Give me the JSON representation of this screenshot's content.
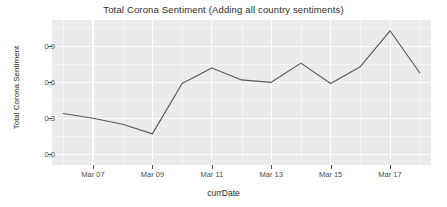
{
  "chart_data": {
    "type": "line",
    "title": "Total Corona Sentiment (Adding all country sentiments)",
    "xlabel": "currDate",
    "ylabel": "Total Corona Sentiment",
    "x": [
      "Mar 06",
      "Mar 07",
      "Mar 08",
      "Mar 09",
      "Mar 10",
      "Mar 11",
      "Mar 12",
      "Mar 13",
      "Mar 14",
      "Mar 15",
      "Mar 16",
      "Mar 17",
      "Mar 18"
    ],
    "values": [
      0.34,
      0.3,
      0.25,
      0.17,
      0.59,
      0.72,
      0.62,
      0.6,
      0.76,
      0.59,
      0.73,
      1.03,
      0.68
    ],
    "series": [
      {
        "name": "Total Corona Sentiment",
        "color": "#595959",
        "values": [
          0.34,
          0.3,
          0.25,
          0.17,
          0.59,
          0.72,
          0.62,
          0.6,
          0.76,
          0.59,
          0.73,
          1.03,
          0.68
        ]
      }
    ],
    "y_ticks": [
      "0.0",
      "0.3",
      "0.6",
      "0.9"
    ],
    "y_tick_values": [
      0.0,
      0.3,
      0.6,
      0.9
    ],
    "x_ticks": [
      "Mar 07",
      "Mar 09",
      "Mar 11",
      "Mar 13",
      "Mar 15",
      "Mar 17"
    ],
    "x_tick_values": [
      1,
      3,
      5,
      7,
      9,
      11
    ],
    "ylim": [
      -0.09,
      1.12
    ],
    "xlim": [
      -0.38,
      12.38
    ],
    "grid": true,
    "legend": "none",
    "panel_background": "#ebebeb",
    "grid_color": "#ffffff",
    "line_color": "#595959",
    "text_color": "#4d4d4d"
  }
}
